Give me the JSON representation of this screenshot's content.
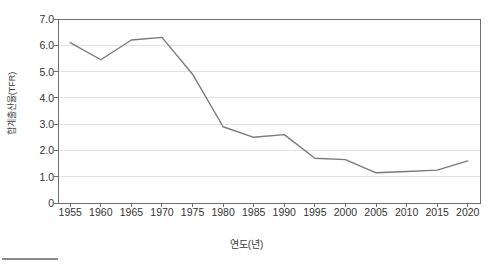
{
  "chart_data": {
    "type": "line",
    "title": "",
    "xlabel": "연도(년)",
    "ylabel": "합계출산율(TFR)",
    "xlim": [
      1953,
      2022
    ],
    "ylim": [
      0,
      7.0
    ],
    "grid": true,
    "legend": null,
    "line_color": "#7a7a7a",
    "x": [
      1955,
      1960,
      1965,
      1970,
      1975,
      1980,
      1985,
      1990,
      1995,
      2000,
      2005,
      2010,
      2015,
      2020
    ],
    "xtick_labels": [
      "1955",
      "1960",
      "1965",
      "1970",
      "1975",
      "1980",
      "1985",
      "1990",
      "1995",
      "2000",
      "2005",
      "2010",
      "2015",
      "2020"
    ],
    "ytick_labels": [
      "0",
      "1.0",
      "2.0",
      "3.0",
      "4.0",
      "5.0",
      "6.0",
      "7.0"
    ],
    "ytick_values": [
      0,
      1.0,
      2.0,
      3.0,
      4.0,
      5.0,
      6.0,
      7.0
    ],
    "series": [
      {
        "name": "합계출산율(TFR)",
        "values": [
          6.1,
          5.45,
          6.2,
          6.3,
          4.9,
          2.9,
          2.5,
          2.6,
          1.7,
          1.65,
          1.15,
          1.2,
          1.25,
          1.6
        ]
      }
    ]
  },
  "axes": {
    "y_title": "합계출산율(TFR)",
    "x_title": "연도(년)"
  },
  "colors": {
    "line": "#7a7a7a",
    "grid": "#e2e2e2",
    "frame": "#6e6e6e",
    "tick_text": "#333333",
    "footer_rule": "#8a8a8a"
  }
}
